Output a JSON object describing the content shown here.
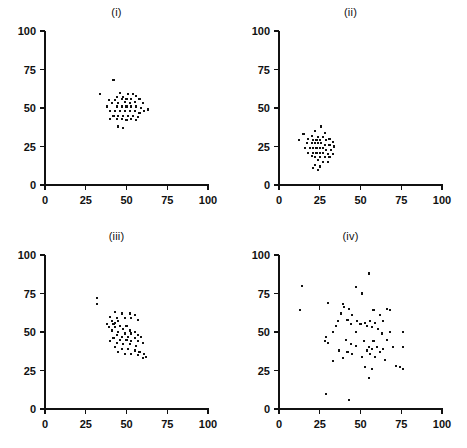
{
  "figure": {
    "panel_count": 4,
    "marker_color": "#111111",
    "background_color": "#ffffff",
    "axis_color": "#111111"
  },
  "chart_data": [
    {
      "type": "scatter",
      "title": "(i)",
      "xlabel": "",
      "ylabel": "",
      "xlim": [
        0,
        100
      ],
      "ylim": [
        0,
        100
      ],
      "xticks": [
        0,
        25,
        50,
        75,
        100
      ],
      "yticks": [
        0,
        25,
        50,
        75,
        100
      ],
      "xtick_labels": [
        "0",
        "25",
        "50",
        "75",
        "100"
      ],
      "ytick_labels": [
        "0",
        "25",
        "50",
        "75",
        "100"
      ],
      "grid": false,
      "legend": false,
      "description": "tight circular cluster centered near (50, 51), no correlation",
      "points": [
        [
          42,
          68
        ],
        [
          34,
          59
        ],
        [
          46,
          60
        ],
        [
          51,
          59
        ],
        [
          54,
          59
        ],
        [
          44,
          57
        ],
        [
          48,
          57
        ],
        [
          56,
          58
        ],
        [
          39,
          55
        ],
        [
          43,
          55
        ],
        [
          47,
          56
        ],
        [
          50,
          56
        ],
        [
          53,
          56
        ],
        [
          58,
          56
        ],
        [
          41,
          53
        ],
        [
          45,
          53
        ],
        [
          49,
          54
        ],
        [
          52,
          53
        ],
        [
          55,
          54
        ],
        [
          60,
          53
        ],
        [
          38,
          51
        ],
        [
          44,
          51
        ],
        [
          47,
          51
        ],
        [
          50,
          51
        ],
        [
          53,
          51
        ],
        [
          56,
          51
        ],
        [
          59,
          50
        ],
        [
          63,
          49
        ],
        [
          40,
          48
        ],
        [
          43,
          48
        ],
        [
          46,
          48
        ],
        [
          49,
          48
        ],
        [
          52,
          48
        ],
        [
          55,
          48
        ],
        [
          58,
          47
        ],
        [
          61,
          48
        ],
        [
          42,
          45
        ],
        [
          45,
          45
        ],
        [
          48,
          45
        ],
        [
          51,
          45
        ],
        [
          54,
          45
        ],
        [
          57,
          44
        ],
        [
          40,
          43
        ],
        [
          44,
          43
        ],
        [
          47,
          43
        ],
        [
          50,
          42
        ],
        [
          53,
          43
        ],
        [
          56,
          42
        ],
        [
          45,
          38
        ],
        [
          48,
          37
        ]
      ]
    },
    {
      "type": "scatter",
      "title": "(ii)",
      "xlabel": "",
      "ylabel": "",
      "xlim": [
        0,
        100
      ],
      "ylim": [
        0,
        100
      ],
      "xticks": [
        0,
        25,
        50,
        75,
        100
      ],
      "yticks": [
        0,
        25,
        50,
        75,
        100
      ],
      "xtick_labels": [
        "0",
        "25",
        "50",
        "75",
        "100"
      ],
      "ytick_labels": [
        "0",
        "25",
        "50",
        "75",
        "100"
      ],
      "grid": false,
      "legend": false,
      "description": "tight cluster centered near (25, 25), located low and left",
      "points": [
        [
          26,
          38
        ],
        [
          22,
          35
        ],
        [
          28,
          34
        ],
        [
          15,
          33
        ],
        [
          20,
          32
        ],
        [
          24,
          31
        ],
        [
          27,
          31
        ],
        [
          31,
          30
        ],
        [
          12,
          29
        ],
        [
          18,
          30
        ],
        [
          21,
          29
        ],
        [
          23,
          29
        ],
        [
          25,
          29
        ],
        [
          29,
          29
        ],
        [
          33,
          28
        ],
        [
          17,
          27
        ],
        [
          20,
          27
        ],
        [
          22,
          27
        ],
        [
          24,
          27
        ],
        [
          26,
          27
        ],
        [
          28,
          26
        ],
        [
          31,
          26
        ],
        [
          34,
          25
        ],
        [
          16,
          24
        ],
        [
          19,
          24
        ],
        [
          21,
          24
        ],
        [
          23,
          24
        ],
        [
          25,
          24
        ],
        [
          27,
          24
        ],
        [
          29,
          23
        ],
        [
          32,
          23
        ],
        [
          18,
          21
        ],
        [
          21,
          21
        ],
        [
          23,
          21
        ],
        [
          25,
          21
        ],
        [
          27,
          21
        ],
        [
          30,
          20
        ],
        [
          33,
          20
        ],
        [
          20,
          19
        ],
        [
          22,
          18
        ],
        [
          25,
          18
        ],
        [
          28,
          18
        ],
        [
          31,
          18
        ],
        [
          24,
          16
        ],
        [
          27,
          15
        ],
        [
          30,
          15
        ],
        [
          22,
          13
        ],
        [
          25,
          12
        ],
        [
          21,
          11
        ],
        [
          24,
          10
        ]
      ]
    },
    {
      "type": "scatter",
      "title": "(iii)",
      "xlabel": "",
      "ylabel": "",
      "xlim": [
        0,
        100
      ],
      "ylim": [
        0,
        100
      ],
      "xticks": [
        0,
        25,
        50,
        75,
        100
      ],
      "yticks": [
        0,
        25,
        50,
        75,
        100
      ],
      "xtick_labels": [
        "0",
        "25",
        "50",
        "75",
        "100"
      ],
      "ytick_labels": [
        "0",
        "25",
        "50",
        "75",
        "100"
      ],
      "grid": false,
      "legend": false,
      "description": "elongated cluster with strong negative correlation from (32,72) to (62,33)",
      "points": [
        [
          32,
          72
        ],
        [
          32,
          68
        ],
        [
          43,
          63
        ],
        [
          47,
          62
        ],
        [
          52,
          62
        ],
        [
          55,
          61
        ],
        [
          40,
          60
        ],
        [
          44,
          59
        ],
        [
          49,
          59
        ],
        [
          53,
          59
        ],
        [
          57,
          58
        ],
        [
          41,
          57
        ],
        [
          45,
          57
        ],
        [
          43,
          56
        ],
        [
          38,
          55
        ],
        [
          42,
          55
        ],
        [
          46,
          54
        ],
        [
          50,
          54
        ],
        [
          39,
          53
        ],
        [
          43,
          53
        ],
        [
          48,
          52
        ],
        [
          52,
          51
        ],
        [
          55,
          50
        ],
        [
          41,
          51
        ],
        [
          45,
          50
        ],
        [
          49,
          49
        ],
        [
          53,
          49
        ],
        [
          57,
          48
        ],
        [
          59,
          47
        ],
        [
          44,
          48
        ],
        [
          47,
          47
        ],
        [
          51,
          47
        ],
        [
          55,
          46
        ],
        [
          42,
          46
        ],
        [
          46,
          45
        ],
        [
          50,
          45
        ],
        [
          53,
          44
        ],
        [
          57,
          44
        ],
        [
          60,
          43
        ],
        [
          40,
          44
        ],
        [
          44,
          43
        ],
        [
          48,
          42
        ],
        [
          52,
          42
        ],
        [
          56,
          41
        ],
        [
          43,
          40
        ],
        [
          47,
          39
        ],
        [
          51,
          39
        ],
        [
          55,
          38
        ],
        [
          58,
          37
        ],
        [
          61,
          36
        ],
        [
          45,
          37
        ],
        [
          49,
          36
        ],
        [
          53,
          36
        ],
        [
          57,
          35
        ],
        [
          62,
          34
        ],
        [
          60,
          33
        ]
      ]
    },
    {
      "type": "scatter",
      "title": "(iv)",
      "xlabel": "",
      "ylabel": "",
      "xlim": [
        0,
        100
      ],
      "ylim": [
        0,
        100
      ],
      "xticks": [
        0,
        25,
        50,
        75,
        100
      ],
      "yticks": [
        0,
        25,
        50,
        75,
        100
      ],
      "xtick_labels": [
        "0",
        "25",
        "50",
        "75",
        "100"
      ],
      "ytick_labels": [
        "0",
        "25",
        "50",
        "75",
        "100"
      ],
      "grid": false,
      "legend": false,
      "description": "wide diffuse cloud centered near (50, 50), high variance, no correlation",
      "points": [
        [
          55,
          88
        ],
        [
          14,
          80
        ],
        [
          47,
          79
        ],
        [
          51,
          75
        ],
        [
          30,
          69
        ],
        [
          13,
          64
        ],
        [
          39,
          68
        ],
        [
          40,
          66
        ],
        [
          43,
          65
        ],
        [
          58,
          64
        ],
        [
          66,
          65
        ],
        [
          68,
          64
        ],
        [
          38,
          62
        ],
        [
          45,
          61
        ],
        [
          62,
          61
        ],
        [
          36,
          57
        ],
        [
          42,
          58
        ],
        [
          48,
          57
        ],
        [
          53,
          56
        ],
        [
          56,
          57
        ],
        [
          59,
          56
        ],
        [
          64,
          57
        ],
        [
          35,
          54
        ],
        [
          44,
          55
        ],
        [
          50,
          55
        ],
        [
          54,
          54
        ],
        [
          57,
          53
        ],
        [
          61,
          52
        ],
        [
          29,
          47
        ],
        [
          33,
          50
        ],
        [
          47,
          50
        ],
        [
          63,
          49
        ],
        [
          68,
          50
        ],
        [
          76,
          50
        ],
        [
          28,
          44
        ],
        [
          30,
          43
        ],
        [
          41,
          45
        ],
        [
          52,
          44
        ],
        [
          58,
          44
        ],
        [
          66,
          45
        ],
        [
          44,
          42
        ],
        [
          47,
          41
        ],
        [
          55,
          40
        ],
        [
          57,
          39
        ],
        [
          60,
          40
        ],
        [
          64,
          39
        ],
        [
          70,
          40
        ],
        [
          76,
          40
        ],
        [
          37,
          38
        ],
        [
          42,
          37
        ],
        [
          45,
          36
        ],
        [
          54,
          38
        ],
        [
          56,
          36
        ],
        [
          59,
          34
        ],
        [
          62,
          37
        ],
        [
          33,
          31
        ],
        [
          39,
          33
        ],
        [
          51,
          34
        ],
        [
          65,
          32
        ],
        [
          72,
          28
        ],
        [
          53,
          27
        ],
        [
          57,
          26
        ],
        [
          74,
          27
        ],
        [
          76,
          26
        ],
        [
          55,
          20
        ],
        [
          29,
          10
        ],
        [
          43,
          6
        ]
      ]
    }
  ]
}
